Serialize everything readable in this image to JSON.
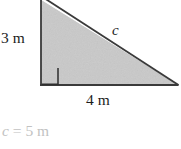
{
  "figure": {
    "kind": "right-triangle-diagram",
    "title_text": "",
    "colors": {
      "triangle_fill": "#c9c9c9",
      "triangle_stroke": "#3a3a3a",
      "label_text": "#1c1c1c",
      "answer_text": "#c2c2c2",
      "background": "#ffffff"
    },
    "labels": {
      "vertical_leg": "3 m",
      "horizontal_leg": "4 m",
      "hypotenuse": "c",
      "right_angle_marker": "right-angle-square"
    },
    "answer": {
      "variable": "c",
      "equals": "=",
      "value": "5 m",
      "full_text": "c = 5 m"
    },
    "geometry": {
      "apex": [
        41,
        0
      ],
      "right_angle_vertex": [
        41,
        85
      ],
      "far_vertex": [
        178,
        85
      ],
      "right_angle_box_size": 17,
      "stroke_width": 1.6
    },
    "measurements": {
      "leg_a_m": 3,
      "leg_b_m": 4,
      "hypotenuse_m": 5,
      "unit": "m"
    }
  }
}
